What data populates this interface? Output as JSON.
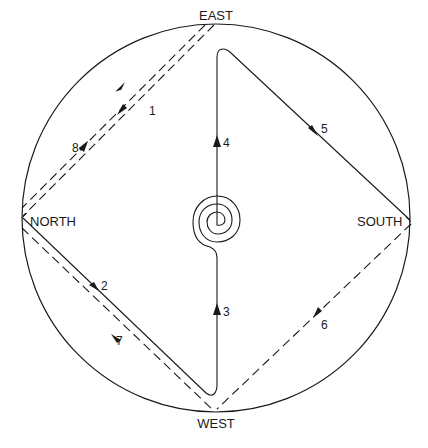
{
  "diagram": {
    "type": "directional-path-diagram",
    "colors": {
      "ink": "#1a1a1a",
      "background": "#ffffff"
    },
    "boundary": {
      "shape": "circle",
      "cx": 216,
      "cy": 218,
      "r": 194
    },
    "compass": {
      "east": {
        "label": "EAST",
        "x": 216,
        "y": 20
      },
      "north": {
        "label": "NORTH",
        "x": 30,
        "y": 226
      },
      "south": {
        "label": "SOUTH",
        "x": 357,
        "y": 226
      },
      "west": {
        "label": "WEST",
        "x": 216,
        "y": 428
      }
    },
    "center": {
      "symbol": "spiral",
      "cx": 217,
      "cy": 218
    },
    "segments": [
      {
        "step": "1",
        "from": "EAST",
        "to": "NORTH",
        "style": "dashed",
        "label_x": 147,
        "label_y": 112
      },
      {
        "step": "2",
        "from": "NORTH",
        "to": "WEST",
        "style": "solid",
        "label_x": 101,
        "label_y": 291
      },
      {
        "step": "3",
        "from": "WEST",
        "to": "CENTER",
        "style": "solid",
        "label_x": 222,
        "label_y": 316
      },
      {
        "step": "4",
        "from": "CENTER",
        "to": "EAST",
        "style": "solid",
        "label_x": 222,
        "label_y": 145
      },
      {
        "step": "5",
        "from": "EAST",
        "to": "SOUTH",
        "style": "solid",
        "label_x": 320,
        "label_y": 132
      },
      {
        "step": "6",
        "from": "SOUTH",
        "to": "WEST",
        "style": "dashed",
        "label_x": 320,
        "label_y": 327
      },
      {
        "step": "7",
        "from": "WEST",
        "to": "NORTH",
        "style": "dashed",
        "label_x": 116,
        "label_y": 344
      },
      {
        "step": "8",
        "from": "NORTH",
        "to": "EAST",
        "style": "dashed",
        "label_x": 72,
        "label_y": 152
      }
    ]
  }
}
